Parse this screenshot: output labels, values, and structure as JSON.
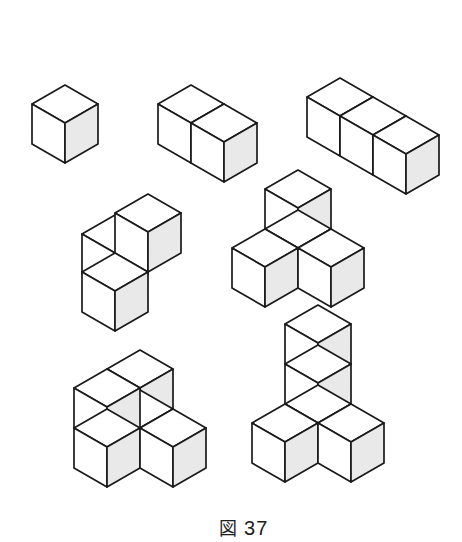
{
  "page": {
    "title": "図 37",
    "background_color": "#ffffff",
    "width": 462,
    "height": 542
  },
  "caption": {
    "label": "図",
    "number": "37",
    "full_text": "図 37"
  },
  "style": {
    "stroke_color": "#1a1a1a",
    "stroke_width": 1.7,
    "face_top_color": "#ffffff",
    "face_left_color": "#ffffff",
    "face_right_color": "#e9e9e9"
  },
  "geometry": {
    "half_width": 33,
    "half_depth": 19,
    "height": 40,
    "note": "isometric cube: top face is a rhombus of half-width 33 and half-depth 19; vertical side height 40"
  },
  "figures": [
    {
      "id": "fig-1-single-cube",
      "name": "single-cube",
      "cube_count": 1,
      "origin": {
        "x": 65,
        "y": 85
      },
      "cubes": [
        {
          "x": 0,
          "y": 0,
          "z": 0
        }
      ]
    },
    {
      "id": "fig-2-two-cube-row",
      "name": "two-cube-row",
      "cube_count": 2,
      "origin": {
        "x": 191,
        "y": 85
      },
      "cubes": [
        {
          "x": 0,
          "y": 0,
          "z": 0
        },
        {
          "x": 1,
          "y": 0,
          "z": 0
        }
      ]
    },
    {
      "id": "fig-3-three-cube-row",
      "name": "three-cube-row",
      "cube_count": 3,
      "origin": {
        "x": 340,
        "y": 78
      },
      "cubes": [
        {
          "x": 0,
          "y": 0,
          "z": 0
        },
        {
          "x": 1,
          "y": 0,
          "z": 0
        },
        {
          "x": 2,
          "y": 0,
          "z": 0
        }
      ]
    },
    {
      "id": "fig-4-tripod",
      "name": "tripod-three-cube",
      "cube_count": 3,
      "origin": {
        "x": 115,
        "y": 215
      },
      "cubes": [
        {
          "x": 0,
          "y": 0,
          "z": 0
        },
        {
          "x": 1,
          "y": 1,
          "z": 0
        },
        {
          "x": 1,
          "y": 0,
          "z": 1
        }
      ]
    },
    {
      "id": "fig-5-cross",
      "name": "cross-four-cube",
      "cube_count": 4,
      "origin": {
        "x": 298,
        "y": 210
      },
      "cubes": [
        {
          "x": 0,
          "y": 1,
          "z": 0
        },
        {
          "x": 0,
          "y": 0,
          "z": 0
        },
        {
          "x": 1,
          "y": 0,
          "z": 0
        },
        {
          "x": 0,
          "y": 0,
          "z": 1
        }
      ]
    },
    {
      "id": "fig-6-zigzag",
      "name": "zigzag-four-cube",
      "cube_count": 4,
      "origin": {
        "x": 140,
        "y": 390
      },
      "cubes": [
        {
          "x": 0,
          "y": 1,
          "z": 0
        },
        {
          "x": 0,
          "y": 0,
          "z": 0
        },
        {
          "x": 1,
          "y": 0,
          "z": 0
        },
        {
          "x": 0,
          "y": 0,
          "z": 1
        },
        {
          "x": 0,
          "y": 1,
          "z": 1
        }
      ]
    },
    {
      "id": "fig-7-staircase",
      "name": "staircase-five-cube",
      "cube_count": 5,
      "origin": {
        "x": 318,
        "y": 385
      },
      "cubes": [
        {
          "x": 0,
          "y": 1,
          "z": 0
        },
        {
          "x": 0,
          "y": 0,
          "z": 0
        },
        {
          "x": 1,
          "y": 0,
          "z": 0
        },
        {
          "x": 0,
          "y": 0,
          "z": 1
        },
        {
          "x": 0,
          "y": 0,
          "z": 2
        }
      ]
    }
  ],
  "figure_labels": {
    "row1": [
      "1 cube",
      "2 cubes",
      "3 cubes"
    ],
    "row2": [
      "3 cubes",
      "4 cubes"
    ],
    "row3": [
      "4 cubes",
      "5 cubes"
    ]
  }
}
